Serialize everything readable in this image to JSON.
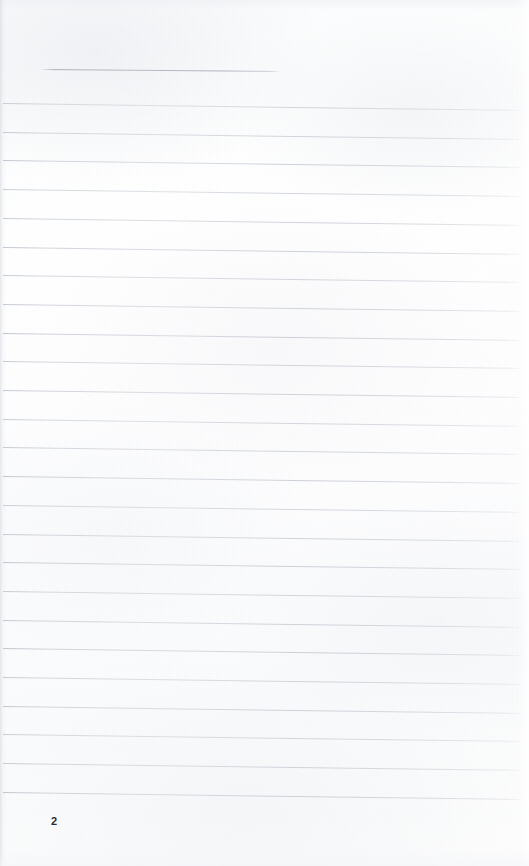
{
  "document": {
    "kind": "scanned-ruled-notebook-page",
    "page_number": "2",
    "paper_color": "#fdfdfe",
    "rule_color": "#c4c9d0",
    "header_rule_color": "#aeb4bf",
    "page_number_color": "#2b2e33",
    "width": 529,
    "height": 866,
    "body_text": ""
  },
  "header_rule": {
    "label": "header-divider",
    "x_start": 42,
    "x_end": 280,
    "y": 69,
    "slant_px": 2
  },
  "ruled_lines": {
    "count": 25,
    "first_y": 103,
    "spacing": 28.7,
    "x_start": 3,
    "x_end": 522,
    "slant_px": 7,
    "y_positions": [
      103,
      131.7,
      160.4,
      189.1,
      217.8,
      246.5,
      275.2,
      303.9,
      332.6,
      361.3,
      390.0,
      418.7,
      447.4,
      476.1,
      504.8,
      533.5,
      562.2,
      590.9,
      619.6,
      648.3,
      677.0,
      705.7,
      734.4,
      763.1,
      791.8
    ]
  },
  "footer": {
    "page_number": "2",
    "x": 51,
    "y": 816
  }
}
